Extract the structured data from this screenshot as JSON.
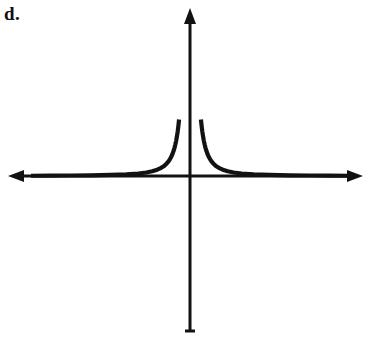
{
  "figure": {
    "part_label": "d.",
    "background_color": "#ffffff",
    "ink_color": "#121212"
  },
  "chart_data": {
    "type": "line",
    "title": "",
    "subtitle": "",
    "xlabel": "",
    "ylabel": "",
    "function": "y = 1 / x^2",
    "grid": false,
    "legend": null,
    "axes": {
      "x_axis": {
        "visible": true,
        "arrow_start": true,
        "arrow_end": true,
        "tick_labels": [],
        "origin_px": [
          190,
          176
        ]
      },
      "y_axis": {
        "visible": true,
        "arrow_start": false,
        "arrow_end": true,
        "tick_labels": [],
        "origin_px": [
          190,
          176
        ]
      }
    },
    "asymptotes": [
      {
        "kind": "vertical",
        "value": 0,
        "drawn": false
      },
      {
        "kind": "horizontal",
        "value": 0,
        "drawn": false
      }
    ],
    "xlim": [
      -8,
      8
    ],
    "ylim": [
      0,
      9
    ],
    "series": [
      {
        "name": "left branch",
        "x": [
          -8.0,
          -7.0,
          -6.0,
          -5.0,
          -4.0,
          -3.2,
          -2.6,
          -2.2,
          -1.9,
          -1.65,
          -1.45,
          -1.3,
          -1.18,
          -1.08,
          -1.0,
          -0.93,
          -0.87,
          -0.82,
          -0.78,
          -0.74,
          -0.7,
          -0.66,
          -0.62,
          -0.585,
          -0.55
        ],
        "y": [
          0.0156,
          0.0204,
          0.0278,
          0.04,
          0.0625,
          0.0977,
          0.1479,
          0.2066,
          0.277,
          0.3673,
          0.4756,
          0.5917,
          0.7183,
          0.8573,
          1.0,
          1.156,
          1.321,
          1.487,
          1.644,
          1.826,
          2.041,
          2.295,
          2.602,
          2.922,
          3.306
        ]
      },
      {
        "name": "right branch",
        "x": [
          0.55,
          0.585,
          0.62,
          0.66,
          0.7,
          0.74,
          0.78,
          0.82,
          0.87,
          0.93,
          1.0,
          1.08,
          1.18,
          1.3,
          1.45,
          1.65,
          1.9,
          2.2,
          2.6,
          3.2,
          4.0,
          5.0,
          6.0,
          7.0,
          8.0
        ],
        "y": [
          3.306,
          2.922,
          2.602,
          2.295,
          2.041,
          1.826,
          1.644,
          1.487,
          1.321,
          1.156,
          1.0,
          0.8573,
          0.7183,
          0.5917,
          0.4756,
          0.3673,
          0.277,
          0.2066,
          0.1479,
          0.0977,
          0.0625,
          0.04,
          0.0278,
          0.0204,
          0.0156
        ]
      }
    ],
    "annotations": [
      {
        "text": "d.",
        "position": "top-left",
        "role": "multiple-choice-part-label"
      }
    ]
  }
}
